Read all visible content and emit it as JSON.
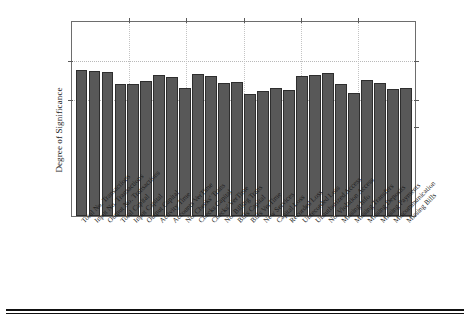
{
  "chart_data": {
    "type": "bar",
    "title": "",
    "subtitle": "",
    "xlabel": "",
    "ylabel": "Degree of Significance",
    "ylim": [
      0,
      10
    ],
    "grid": true,
    "legend": false,
    "y_tick_labels": [],
    "x_tick_labels_rotated_deg": 45,
    "categories": [
      "Total No. Transactions",
      "Input No. Transactions",
      "Output No. Transactions",
      "Total Capital",
      "Input Capital",
      "Output Capital",
      "Activity Time",
      "Accounts VerTime",
      "No. Checks' Trans",
      "Checks Capital",
      "Checks' VerTime",
      "No. Billing Trans",
      "Bills Capital",
      "Bills VerTime",
      "New Services",
      "Capital Loss",
      "Recorded Loss",
      "Unrecorded Loss",
      "Unauthorized Access",
      "No. Violation Access",
      "Missing Info",
      "Missing Transfers",
      "Missing Deposits",
      "Missing Payments",
      "Miscommunication",
      "Missing Bills"
    ],
    "values": [
      7.55,
      7.45,
      7.42,
      6.82,
      6.78,
      6.95,
      7.25,
      7.18,
      6.6,
      7.3,
      7.22,
      6.88,
      6.9,
      6.3,
      6.42,
      6.58,
      6.48,
      7.22,
      7.28,
      7.38,
      6.78,
      6.35,
      7.0,
      6.85,
      6.55,
      6.62
    ]
  }
}
